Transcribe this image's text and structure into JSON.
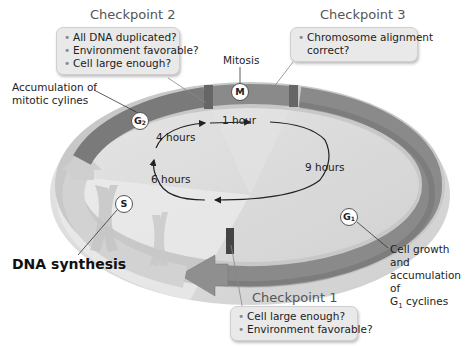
{
  "checkpoints": [
    {
      "title": "Checkpoint 1",
      "questions": [
        "Cell large enough?",
        "Environment favorable?"
      ]
    },
    {
      "title": "Checkpoint 2",
      "questions": [
        "All DNA duplicated?",
        "Environment favorable?",
        "Cell large enough?"
      ]
    },
    {
      "title": "Checkpoint 3",
      "questions": [
        "Chromosome alignment",
        "correct?"
      ]
    }
  ],
  "phases": {
    "M": {
      "symbol": "M",
      "label": "Mitosis"
    },
    "G1": {
      "symbol": "G",
      "subscript": "1",
      "label_lines": [
        "Cell growth and",
        "accumulation of",
        "G1 cyclines"
      ]
    },
    "G2": {
      "symbol": "G",
      "subscript": "2",
      "label_lines": [
        "Accumulation of",
        "mitotic cylines"
      ]
    },
    "S": {
      "symbol": "S",
      "label": "DNA synthesis"
    }
  },
  "durations": {
    "M": "1 hour",
    "G2": "4 hours",
    "S": "6 hours",
    "G1": "9 hours"
  },
  "colors": {
    "ring_dark": "#7a7a7a",
    "ring_light": "#bdbdbd",
    "disk": "#dcdcdc",
    "box_bg": "#e9e9e9"
  }
}
